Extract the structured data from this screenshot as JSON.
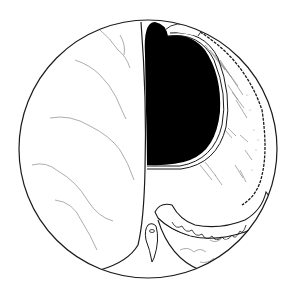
{
  "figure": {
    "kind": "line-drawing illustration",
    "view": "circular endoscopic-style field",
    "colors": {
      "background": "#ffffff",
      "ink": "#1a1a1a",
      "lumen": "#000000",
      "vessel": "#8a8a8a"
    },
    "elements": [
      {
        "name": "circular-field-border"
      },
      {
        "name": "left-smooth-fold"
      },
      {
        "name": "dark-lumen"
      },
      {
        "name": "lumen-rim-rings"
      },
      {
        "name": "right-textured-wall"
      },
      {
        "name": "scalloped-lower-fold"
      },
      {
        "name": "bottom-right-fold"
      },
      {
        "name": "central-small-structure"
      }
    ]
  }
}
